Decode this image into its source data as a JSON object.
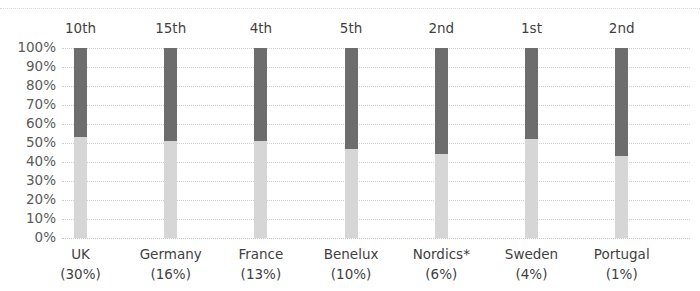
{
  "chart_data": {
    "type": "bar",
    "title": "",
    "subtitle": "",
    "xlabel": "",
    "ylabel": "",
    "ylim": [
      0,
      100
    ],
    "grid": true,
    "legend_position": "none",
    "stacked": true,
    "categories": [
      "UK",
      "Germany",
      "France",
      "Benelux",
      "Nordics*",
      "Sweden",
      "Portugal"
    ],
    "category_shares": [
      "(30%)",
      "(16%)",
      "(13%)",
      "(10%)",
      "(6%)",
      "(4%)",
      "(1%)"
    ],
    "rank_annotations": [
      "10th",
      "15th",
      "4th",
      "5th",
      "2nd",
      "1st",
      "2nd"
    ],
    "y_ticks": [
      "100%",
      "90%",
      "80%",
      "70%",
      "60%",
      "50%",
      "40%",
      "30%",
      "20%",
      "10%",
      "0%"
    ],
    "y_tick_values": [
      100,
      90,
      80,
      70,
      60,
      50,
      40,
      30,
      20,
      10,
      0
    ],
    "series": [
      {
        "name": "lower-segment",
        "color": "#d6d6d6",
        "values": [
          53,
          51,
          51,
          47,
          44,
          52,
          43
        ]
      },
      {
        "name": "upper-segment",
        "color": "#6d6d6d",
        "values": [
          47,
          49,
          49,
          53,
          56,
          48,
          57
        ]
      }
    ],
    "bar_totals": [
      100,
      100,
      100,
      100,
      100,
      100,
      100
    ],
    "footnote": "*"
  },
  "colors": {
    "background": "#ffffff",
    "segment_dark": "#6d6d6d",
    "segment_light": "#d6d6d6",
    "gridline": "#cfcfcf",
    "tick_text": "#5a5a5a",
    "label_text": "#3f3f3f"
  }
}
